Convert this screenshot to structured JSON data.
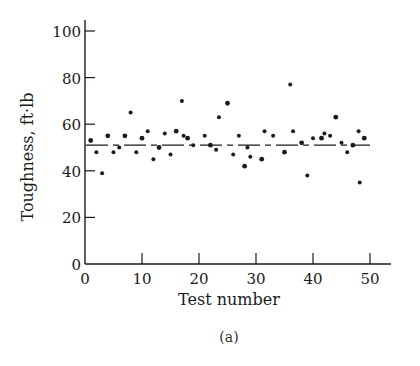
{
  "chart_data": {
    "type": "scatter",
    "title": "",
    "caption": "(a)",
    "xlabel": "Test number",
    "ylabel": "Toughness, ft·lb",
    "xlim": [
      0,
      53
    ],
    "ylim": [
      0,
      100
    ],
    "x_ticks": [
      0,
      10,
      20,
      30,
      40,
      50
    ],
    "y_ticks": [
      0,
      20,
      40,
      60,
      80,
      100
    ],
    "grid": false,
    "legend": null,
    "mean_line": {
      "value": 51,
      "style": "dashed"
    },
    "series": [
      {
        "name": "Toughness",
        "points": [
          [
            1,
            53
          ],
          [
            2,
            48
          ],
          [
            3,
            39
          ],
          [
            4,
            55
          ],
          [
            5,
            48
          ],
          [
            6,
            50
          ],
          [
            7,
            55
          ],
          [
            8,
            65
          ],
          [
            9,
            48
          ],
          [
            10,
            54
          ],
          [
            11,
            57
          ],
          [
            12,
            45
          ],
          [
            13,
            50
          ],
          [
            14,
            56
          ],
          [
            15,
            47
          ],
          [
            16,
            57
          ],
          [
            17,
            70
          ],
          [
            17.3,
            55
          ],
          [
            18,
            54
          ],
          [
            19,
            51
          ],
          [
            21,
            55
          ],
          [
            22,
            51
          ],
          [
            23,
            49
          ],
          [
            23.5,
            63
          ],
          [
            25,
            69
          ],
          [
            26,
            47
          ],
          [
            27,
            55
          ],
          [
            28,
            42
          ],
          [
            28.5,
            50
          ],
          [
            29,
            46
          ],
          [
            31,
            45
          ],
          [
            31.5,
            57
          ],
          [
            33,
            55
          ],
          [
            35,
            48
          ],
          [
            36,
            77
          ],
          [
            36.5,
            57
          ],
          [
            38,
            52
          ],
          [
            39,
            38
          ],
          [
            40,
            54
          ],
          [
            41.5,
            54
          ],
          [
            42,
            56
          ],
          [
            43,
            55
          ],
          [
            44,
            63
          ],
          [
            45,
            52
          ],
          [
            46,
            48
          ],
          [
            47,
            51
          ],
          [
            48,
            57
          ],
          [
            48.2,
            35
          ],
          [
            49,
            54
          ]
        ]
      }
    ]
  },
  "colors": {
    "ink": "#1a1a1a",
    "background": "#ffffff"
  }
}
